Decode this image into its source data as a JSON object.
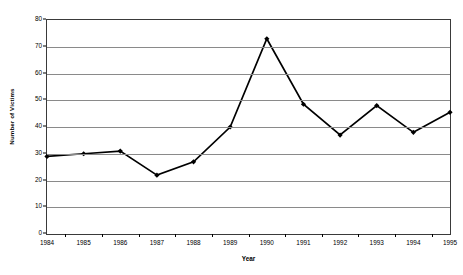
{
  "chart_data": {
    "type": "line",
    "title": "",
    "xlabel": "Year",
    "ylabel": "Number of Victims",
    "categories": [
      "1984",
      "1985",
      "1986",
      "1987",
      "1988",
      "1989",
      "1990",
      "1991",
      "1992",
      "1993",
      "1994",
      "1995"
    ],
    "values": [
      29,
      30,
      31,
      22,
      27,
      40,
      73,
      48.5,
      37,
      48,
      38,
      45.5
    ],
    "series": [
      {
        "name": "Number of Victims",
        "values": [
          29,
          30,
          31,
          22,
          27,
          40,
          73,
          48.5,
          37,
          48,
          38,
          45.5
        ]
      }
    ],
    "ylim": [
      0,
      80
    ],
    "ytick_labels": [
      "0",
      "10",
      "20",
      "30",
      "40",
      "50",
      "60",
      "70",
      "80"
    ],
    "ytick_values": [
      0,
      10,
      20,
      30,
      40,
      50,
      60,
      70,
      80
    ],
    "grid": true,
    "grid_axis": "y",
    "legend": false,
    "legend_position": "none",
    "marker": "diamond",
    "line_color": "#000000",
    "marker_color": "#000000",
    "grid_color": "#8a8a8a",
    "axis_color": "#3a3a3a",
    "background_color": "#ffffff"
  }
}
